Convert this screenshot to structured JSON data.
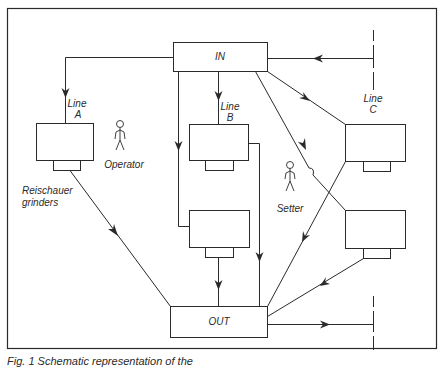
{
  "diagram": {
    "nodes": {
      "in": {
        "label": "IN"
      },
      "out": {
        "label": "OUT"
      }
    },
    "lines": [
      {
        "id": "A",
        "label_line": "Line",
        "label_letter": "A"
      },
      {
        "id": "B",
        "label_line": "Line",
        "label_letter": "B"
      },
      {
        "id": "C",
        "label_line": "Line",
        "label_letter": "C"
      }
    ],
    "labels": {
      "grinders_line1": "Reischauer",
      "grinders_line2": "grinders",
      "operator": "Operator",
      "setter": "Setter"
    },
    "caption": "Fig. 1   Schematic representation of the"
  }
}
